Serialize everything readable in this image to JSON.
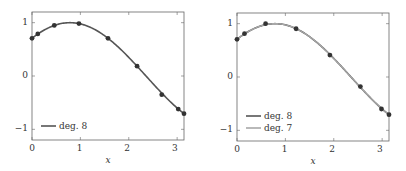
{
  "chart_data": [
    {
      "type": "line",
      "title": "",
      "xlabel": "x",
      "ylabel": "",
      "xlim": [
        0,
        3.1416
      ],
      "ylim": [
        -1.2,
        1.2
      ],
      "xticks": [
        "0",
        "1",
        "2",
        "3"
      ],
      "yticks": [
        "1",
        "0",
        "−1"
      ],
      "grid": false,
      "legend_position": "lower left",
      "series": [
        {
          "name": "deg. 8",
          "color": "#555555",
          "kind": "curve",
          "function": "sin(x + pi/4)"
        }
      ],
      "points": {
        "x": [
          0,
          0.12,
          0.46,
          0.97,
          1.571,
          2.172,
          2.682,
          3.022,
          3.1416
        ],
        "y": [
          0.707,
          0.788,
          0.948,
          0.983,
          0.707,
          0.185,
          -0.35,
          -0.62,
          -0.707
        ]
      }
    },
    {
      "type": "line",
      "title": "",
      "xlabel": "x",
      "ylabel": "",
      "xlim": [
        0,
        3.1416
      ],
      "ylim": [
        -1.2,
        1.2
      ],
      "xticks": [
        "0",
        "1",
        "2",
        "3"
      ],
      "yticks": [
        "1",
        "0",
        "−1"
      ],
      "grid": false,
      "legend_position": "lower left",
      "series": [
        {
          "name": "deg. 8",
          "color": "#555555",
          "kind": "curve",
          "function": "sin(x + pi/4)"
        },
        {
          "name": "deg. 7",
          "color": "#a0a0a0",
          "kind": "curve",
          "function": "sin(x + pi/4)"
        }
      ],
      "points": {
        "x": [
          0,
          0.155,
          0.591,
          1.221,
          1.92,
          2.55,
          2.986,
          3.1416
        ],
        "y": [
          0.707,
          0.812,
          0.999,
          0.905,
          0.411,
          -0.18,
          -0.6,
          -0.707
        ]
      }
    }
  ],
  "plots": [
    {
      "xlabel": "x",
      "xtick_labels": [
        "0",
        "1",
        "2",
        "3"
      ],
      "ytick_labels": [
        "1",
        "0",
        "−1"
      ],
      "legend": [
        "deg. 8"
      ]
    },
    {
      "xlabel": "x",
      "xtick_labels": [
        "0",
        "1",
        "2",
        "3"
      ],
      "ytick_labels": [
        "1",
        "0",
        "−1"
      ],
      "legend": [
        "deg. 8",
        "deg. 7"
      ]
    }
  ]
}
